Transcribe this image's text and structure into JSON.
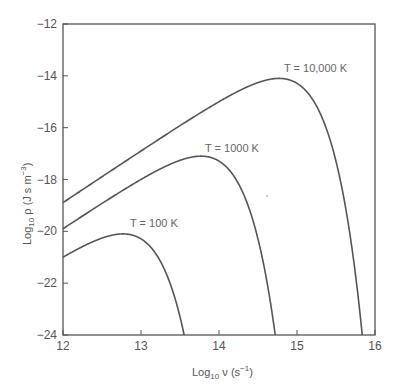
{
  "chart_data": {
    "type": "line",
    "title": "",
    "xlabel": "Log10 ν (s^-1)",
    "ylabel": "Log10 ρ (J s m^-3)",
    "xlim": [
      12,
      16
    ],
    "ylim": [
      -24,
      -12
    ],
    "grid": false,
    "legend": "inline labels",
    "x_ticks": [
      12,
      13,
      14,
      15,
      16
    ],
    "y_ticks": [
      -12,
      -14,
      -16,
      -18,
      -20,
      -22,
      -24
    ],
    "x_tick_labels": [
      "12",
      "13",
      "14",
      "15",
      "16"
    ],
    "y_tick_labels": [
      "−12",
      "−14",
      "−16",
      "−18",
      "−20",
      "−22",
      "−24"
    ],
    "series": [
      {
        "name": "T = 100 K",
        "temperature": 100,
        "x": [
          12.0,
          12.4,
          12.8,
          13.2,
          13.5,
          13.55
        ],
        "y": [
          -21.0,
          -20.4,
          -20.1,
          -21.0,
          -23.3,
          -24.0
        ],
        "peak": [
          12.8,
          -20.1
        ]
      },
      {
        "name": "T = 1000 K",
        "temperature": 1000,
        "x": [
          12.0,
          12.5,
          13.0,
          13.5,
          13.8,
          14.2,
          14.5,
          14.72
        ],
        "y": [
          -20.0,
          -18.9,
          -17.9,
          -17.3,
          -17.1,
          -18.0,
          -20.3,
          -24.0
        ],
        "peak": [
          13.8,
          -17.1
        ]
      },
      {
        "name": "T = 10,000 K",
        "temperature": 10000,
        "x": [
          12.0,
          12.5,
          13.0,
          13.5,
          14.0,
          14.5,
          14.75,
          15.2,
          15.5,
          15.85
        ],
        "y": [
          -18.9,
          -17.7,
          -16.4,
          -15.4,
          -14.6,
          -14.2,
          -14.1,
          -15.0,
          -17.3,
          -24.0
        ],
        "peak": [
          14.75,
          -14.1
        ]
      }
    ]
  },
  "labels": {
    "xlabel_main": "Log",
    "xlabel_sub": "10",
    "xlabel_var": " ν (s",
    "xlabel_sup": "−1",
    "xlabel_end": ")",
    "ylabel_main": "Log",
    "ylabel_sub": "10",
    "ylabel_var": " ρ (J s m",
    "ylabel_sup": "−3",
    "ylabel_end": ")",
    "curve_100": "T = 100 K",
    "curve_1000": "T = 1000 K",
    "curve_10000": "T = 10,000 K"
  },
  "colors": {
    "curve": "#555555",
    "axis": "#555555",
    "text": "#555555"
  }
}
